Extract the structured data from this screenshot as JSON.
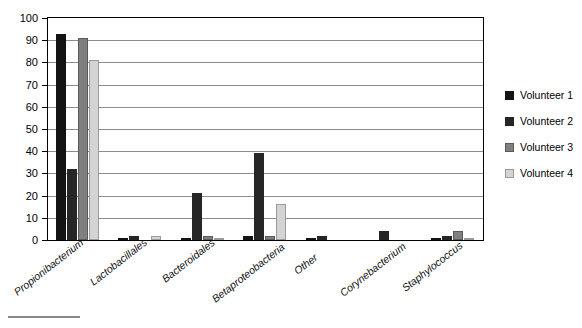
{
  "chart_data": {
    "type": "bar",
    "title": "",
    "xlabel": "",
    "ylabel": "",
    "ylim": [
      0,
      100
    ],
    "yticks": [
      0,
      10,
      20,
      30,
      40,
      50,
      60,
      70,
      80,
      90,
      100
    ],
    "grid": true,
    "legend_position": "right",
    "categories": [
      "Propionibacterium",
      "Lactobacillales",
      "Bacteroidales",
      "Betaproteobacteria",
      "Other",
      "Corynebacterium",
      "Staphylococcus"
    ],
    "series": [
      {
        "name": "Volunteer 1",
        "color": "#141414",
        "values": [
          93,
          1,
          1,
          2,
          1,
          0,
          1
        ]
      },
      {
        "name": "Volunteer 2",
        "color": "#262626",
        "values": [
          32,
          2,
          21,
          39,
          2,
          4,
          2
        ]
      },
      {
        "name": "Volunteer 3",
        "color": "#7f7f7f",
        "values": [
          91,
          0,
          2,
          2,
          0,
          0,
          4
        ]
      },
      {
        "name": "Volunteer 4",
        "color": "#d4d4d4",
        "values": [
          81,
          2,
          1,
          16,
          0,
          0,
          1
        ]
      }
    ]
  },
  "legend": {
    "items": [
      {
        "label": "Volunteer 1"
      },
      {
        "label": "Volunteer 2"
      },
      {
        "label": "Volunteer 3"
      },
      {
        "label": "Volunteer 4"
      }
    ]
  }
}
